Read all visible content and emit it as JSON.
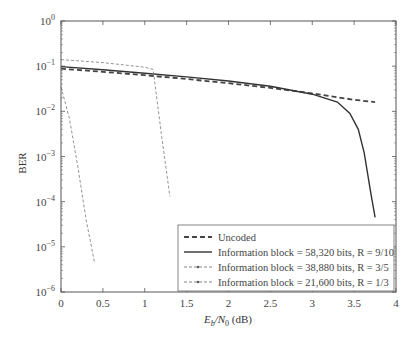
{
  "chart_data": {
    "type": "line",
    "title": "",
    "xlabel": "E_b/N_0 (dB)",
    "ylabel": "BER",
    "xlim": [
      0,
      4
    ],
    "ylim": [
      1e-06,
      1
    ],
    "yscale": "log",
    "grid": false,
    "legend_position": "lower right",
    "x_ticks": [
      "0",
      "0.5",
      "1",
      "1.5",
      "2",
      "2.5",
      "3",
      "3.5",
      "4"
    ],
    "y_ticks": [
      "10^0",
      "10^-1",
      "10^-2",
      "10^-3",
      "10^-4",
      "10^-5",
      "10^-6"
    ],
    "series": [
      {
        "name": "Uncoded",
        "style": "dashed-thick",
        "x": [
          0,
          0.5,
          1.0,
          1.5,
          2.0,
          2.5,
          3.0,
          3.5,
          3.75
        ],
        "y": [
          0.088,
          0.075,
          0.063,
          0.052,
          0.042,
          0.033,
          0.025,
          0.018,
          0.016
        ]
      },
      {
        "name": "Information block = 58,320 bits, R = 9/10",
        "style": "solid",
        "x": [
          0,
          0.5,
          1.0,
          1.5,
          2.0,
          2.5,
          3.0,
          3.3,
          3.45,
          3.55,
          3.62,
          3.7,
          3.75
        ],
        "y": [
          0.098,
          0.083,
          0.07,
          0.058,
          0.047,
          0.036,
          0.024,
          0.016,
          0.009,
          0.004,
          0.0012,
          0.00015,
          4.5e-05
        ]
      },
      {
        "name": "Information block = 38,880 bits, R = 3/5",
        "style": "dashed-thin",
        "x": [
          0,
          0.5,
          1.0,
          1.1,
          1.2,
          1.3
        ],
        "y": [
          0.14,
          0.12,
          0.095,
          0.085,
          0.003,
          0.00013
        ]
      },
      {
        "name": "Information block = 21,600 bits, R = 1/3",
        "style": "dashed-thin",
        "x": [
          0,
          0.1,
          0.2,
          0.3,
          0.4
        ],
        "y": [
          0.035,
          0.007,
          0.0006,
          4e-05,
          4.5e-06
        ]
      }
    ]
  },
  "labels": {
    "ylabel": "BER",
    "xlabel_main": "E",
    "xlabel_sub1": "b",
    "xlabel_mid": "/N",
    "xlabel_sub2": "0",
    "xlabel_unit": " (dB)"
  },
  "legend": [
    {
      "text": "Uncoded"
    },
    {
      "text": "Information block = 58,320 bits, R = 9/10"
    },
    {
      "text": "Information block = 38,880 bits, R = 3/5"
    },
    {
      "text": "Information block = 21,600 bits, R = 1/3"
    }
  ]
}
